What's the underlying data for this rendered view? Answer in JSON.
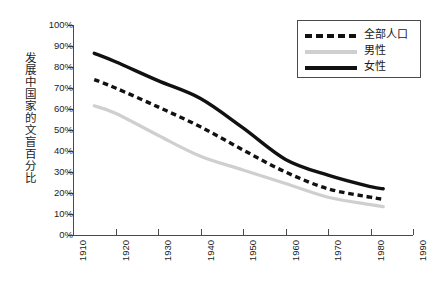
{
  "chart_data": {
    "type": "line",
    "title": "",
    "subtitle": "",
    "xlabel": "",
    "ylabel": "发展中国家的文盲百分比",
    "xlim": [
      1910,
      1990
    ],
    "ylim": [
      0,
      100
    ],
    "grid": false,
    "legend_position": "top-right",
    "x_ticks": [
      "1910",
      "1920",
      "1930",
      "1940",
      "1950",
      "1960",
      "1970",
      "1980",
      "1990"
    ],
    "y_ticks": [
      "0%",
      "10%",
      "20%",
      "30%",
      "40%",
      "50%",
      "60%",
      "70%",
      "80%",
      "90%",
      "100%"
    ],
    "x": [
      1915,
      1920,
      1930,
      1940,
      1950,
      1960,
      1970,
      1980,
      1983
    ],
    "series": [
      {
        "name": "全部人口",
        "style": "dashed",
        "color": "#111111",
        "values": [
          74.0,
          70.0,
          61.0,
          51.5,
          40.5,
          30.0,
          22.0,
          18.0,
          17.0
        ]
      },
      {
        "name": "男性",
        "style": "solid-light",
        "color": "#cfcfcf",
        "values": [
          61.5,
          58.0,
          47.5,
          37.5,
          31.0,
          24.5,
          18.0,
          14.5,
          13.5
        ]
      },
      {
        "name": "女性",
        "style": "solid",
        "color": "#111111",
        "values": [
          86.5,
          82.5,
          73.5,
          65.0,
          51.0,
          36.0,
          28.5,
          23.0,
          22.0
        ]
      }
    ],
    "axis_color": "#4a4a4a"
  },
  "legend": {
    "items": [
      {
        "label": "全部人口",
        "swatch": "dashed-line-swatch"
      },
      {
        "label": "男性",
        "swatch": "gray-line-swatch"
      },
      {
        "label": "女性",
        "swatch": "black-line-swatch"
      }
    ]
  }
}
